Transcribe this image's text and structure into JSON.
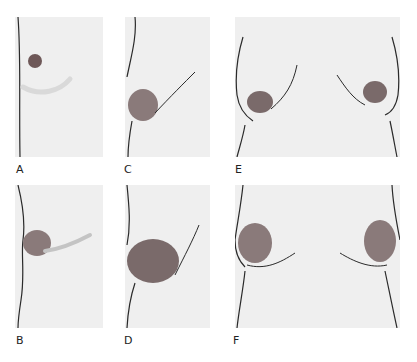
{
  "figure": {
    "panels": [
      {
        "id": "A",
        "label": "A",
        "view": "lateral"
      },
      {
        "id": "B",
        "label": "B",
        "view": "lateral"
      },
      {
        "id": "C",
        "label": "C",
        "view": "lateral"
      },
      {
        "id": "D",
        "label": "D",
        "view": "lateral"
      },
      {
        "id": "E",
        "label": "E",
        "view": "frontal"
      },
      {
        "id": "F",
        "label": "F",
        "view": "frontal"
      }
    ],
    "colors": {
      "panel_background": "#efefef",
      "outline": "#2a2a2a",
      "shading": "#7a6a6a",
      "label": "#222222"
    }
  }
}
